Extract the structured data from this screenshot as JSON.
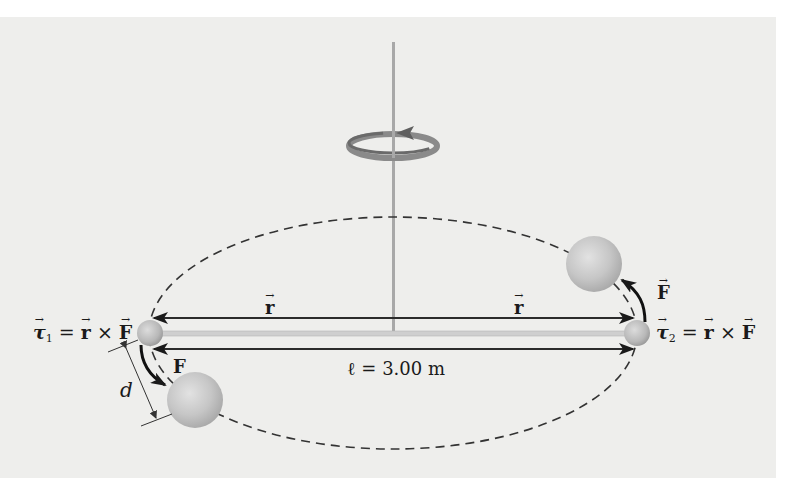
{
  "figure": {
    "type": "physics-diagram"
  },
  "labels": {
    "tau1": {
      "symbol": "τ",
      "subscript": "1",
      "equals": "=",
      "r": "r",
      "times": "×",
      "F": "F"
    },
    "tau2": {
      "symbol": "τ",
      "subscript": "2",
      "equals": "=",
      "r": "r",
      "times": "×",
      "F": "F"
    },
    "r_left": "r",
    "r_right": "r",
    "force_left": "F",
    "force_right": "F",
    "length": "ℓ = 3.00 m",
    "distance": "d"
  },
  "colors": {
    "background": "#eeeeec",
    "arrow": "#2b2b2b",
    "rod": "#c8c8c8",
    "pole": "#a8a8a8",
    "ball": "#c9c9c9",
    "dashed": "#333333",
    "rotation_arrow": "#707070"
  },
  "geometry": {
    "rod_length_label": "3.00 m"
  }
}
